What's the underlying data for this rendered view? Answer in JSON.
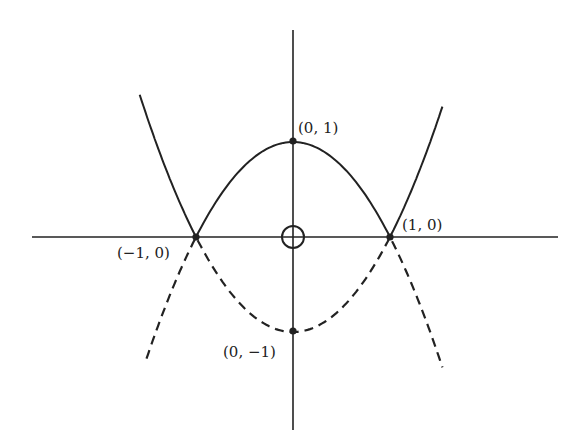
{
  "diagram": {
    "colors": {
      "stroke": "#222222",
      "background": "#ffffff"
    },
    "origin_marker": "circle-plus",
    "points": [
      {
        "id": "top",
        "label": "(0, 1)",
        "x": 0,
        "y": 1
      },
      {
        "id": "left",
        "label": "(−1, 0)",
        "x": -1,
        "y": 0
      },
      {
        "id": "right",
        "label": "(1, 0)",
        "x": 1,
        "y": 0
      },
      {
        "id": "bottom",
        "label": "(0, −1)",
        "x": 0,
        "y": -1
      }
    ],
    "curves": [
      {
        "id": "upper-solid",
        "style": "solid",
        "equation": "y = 1 - x^2 (|x|<=1), y = x^2 - 1 (|x|>=1)"
      },
      {
        "id": "lower-dashed",
        "style": "dashed",
        "equation": "y = x^2 - 1 (|x|<=1), y = 1 - x^2 (|x|>=1)"
      }
    ]
  }
}
